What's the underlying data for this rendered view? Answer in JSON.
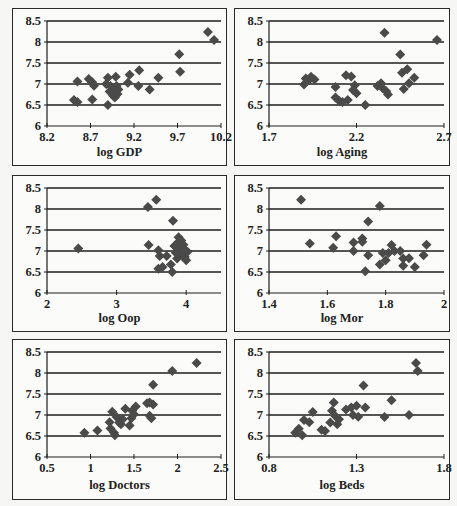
{
  "figure": {
    "panel_count": 6,
    "marker": "diamond",
    "marker_color": "#4a4a4a",
    "gridline_color": "#1e1e1e"
  },
  "chart_data": [
    {
      "type": "scatter",
      "title": "",
      "xlabel": "log GDP",
      "ylabel": "",
      "xlim": [
        8.2,
        10.2
      ],
      "ylim": [
        6,
        8.5
      ],
      "xticks": [
        "8.2",
        "8.7",
        "9.2",
        "9.7",
        "10.2"
      ],
      "xtick_values": [
        8.2,
        8.7,
        9.2,
        9.7,
        10.2
      ],
      "yticks": [
        "6",
        "6.5",
        "7",
        "7.5",
        "8",
        "8.5"
      ],
      "ytick_values": [
        6,
        6.5,
        7,
        7.5,
        8,
        8.5
      ],
      "grid": "horizontal",
      "points": [
        [
          8.51,
          6.62
        ],
        [
          8.55,
          6.57
        ],
        [
          8.55,
          7.06
        ],
        [
          8.68,
          7.12
        ],
        [
          8.72,
          7.04
        ],
        [
          8.72,
          6.63
        ],
        [
          8.74,
          6.96
        ],
        [
          8.88,
          7.0
        ],
        [
          8.9,
          7.15
        ],
        [
          8.9,
          6.5
        ],
        [
          8.92,
          6.82
        ],
        [
          8.93,
          6.95
        ],
        [
          8.95,
          6.78
        ],
        [
          8.96,
          6.72
        ],
        [
          8.97,
          6.88
        ],
        [
          8.98,
          6.68
        ],
        [
          8.99,
          7.17
        ],
        [
          9.0,
          6.95
        ],
        [
          9.01,
          6.76
        ],
        [
          9.02,
          6.87
        ],
        [
          9.13,
          7.03
        ],
        [
          9.15,
          7.22
        ],
        [
          9.25,
          6.95
        ],
        [
          9.26,
          7.33
        ],
        [
          9.38,
          6.87
        ],
        [
          9.48,
          7.15
        ],
        [
          9.72,
          7.71
        ],
        [
          9.73,
          7.29
        ],
        [
          10.05,
          8.24
        ],
        [
          10.12,
          8.05
        ]
      ]
    },
    {
      "type": "scatter",
      "title": "",
      "xlabel": "log Aging",
      "ylabel": "",
      "xlim": [
        1.7,
        2.7
      ],
      "ylim": [
        6,
        8.5
      ],
      "xticks": [
        "1.7",
        "2.2",
        "2.7"
      ],
      "xtick_values": [
        1.7,
        2.2,
        2.7
      ],
      "yticks": [
        "6",
        "6.5",
        "7",
        "7.5",
        "8",
        "8.5"
      ],
      "ytick_values": [
        6,
        6.5,
        7,
        7.5,
        8,
        8.5
      ],
      "grid": "horizontal",
      "points": [
        [
          1.9,
          6.99
        ],
        [
          1.91,
          7.13
        ],
        [
          1.93,
          7.1
        ],
        [
          1.94,
          7.17
        ],
        [
          1.96,
          7.11
        ],
        [
          2.08,
          6.93
        ],
        [
          2.08,
          6.68
        ],
        [
          2.1,
          6.6
        ],
        [
          2.12,
          6.57
        ],
        [
          2.14,
          7.21
        ],
        [
          2.15,
          6.62
        ],
        [
          2.17,
          7.18
        ],
        [
          2.18,
          6.86
        ],
        [
          2.19,
          6.97
        ],
        [
          2.2,
          6.78
        ],
        [
          2.25,
          6.5
        ],
        [
          2.32,
          6.95
        ],
        [
          2.34,
          7.02
        ],
        [
          2.35,
          6.9
        ],
        [
          2.36,
          8.22
        ],
        [
          2.37,
          6.83
        ],
        [
          2.38,
          6.75
        ],
        [
          2.45,
          7.7
        ],
        [
          2.46,
          7.27
        ],
        [
          2.47,
          6.88
        ],
        [
          2.49,
          7.35
        ],
        [
          2.5,
          7.02
        ],
        [
          2.53,
          7.15
        ],
        [
          2.66,
          8.05
        ]
      ]
    },
    {
      "type": "scatter",
      "title": "",
      "xlabel": "log Oop",
      "ylabel": "",
      "xlim": [
        2,
        4.5
      ],
      "ylim": [
        6,
        8.5
      ],
      "xticks": [
        "2",
        "3",
        "4"
      ],
      "xtick_values": [
        2,
        3,
        4
      ],
      "yticks": [
        "6",
        "6.5",
        "7",
        "7.5",
        "8",
        "8.5"
      ],
      "ytick_values": [
        6,
        6.5,
        7,
        7.5,
        8,
        8.5
      ],
      "grid": "horizontal",
      "points": [
        [
          2.45,
          7.06
        ],
        [
          3.45,
          8.05
        ],
        [
          3.57,
          8.22
        ],
        [
          3.46,
          7.14
        ],
        [
          3.6,
          7.02
        ],
        [
          3.62,
          6.88
        ],
        [
          3.6,
          6.58
        ],
        [
          3.66,
          6.62
        ],
        [
          3.72,
          6.88
        ],
        [
          3.78,
          6.68
        ],
        [
          3.8,
          6.5
        ],
        [
          3.81,
          7.72
        ],
        [
          3.83,
          7.12
        ],
        [
          3.85,
          6.96
        ],
        [
          3.87,
          6.82
        ],
        [
          3.88,
          7.2
        ],
        [
          3.89,
          7.33
        ],
        [
          3.9,
          6.98
        ],
        [
          3.92,
          7.08
        ],
        [
          3.93,
          7.25
        ],
        [
          3.94,
          6.9
        ],
        [
          3.95,
          7.02
        ],
        [
          3.96,
          7.15
        ],
        [
          3.98,
          6.86
        ],
        [
          4.0,
          6.78
        ],
        [
          4.02,
          6.98
        ],
        [
          3.97,
          7.05
        ]
      ]
    },
    {
      "type": "scatter",
      "title": "",
      "xlabel": "log Mor",
      "ylabel": "",
      "xlim": [
        1.4,
        2.0
      ],
      "ylim": [
        6,
        8.5
      ],
      "xticks": [
        "1.4",
        "1.6",
        "1.8",
        "2"
      ],
      "xtick_values": [
        1.4,
        1.6,
        1.8,
        2.0
      ],
      "yticks": [
        "6",
        "6.5",
        "7",
        "7.5",
        "8",
        "8.5"
      ],
      "ytick_values": [
        6,
        6.5,
        7,
        7.5,
        8,
        8.5
      ],
      "grid": "horizontal",
      "points": [
        [
          1.51,
          8.22
        ],
        [
          1.54,
          7.18
        ],
        [
          1.62,
          7.08
        ],
        [
          1.63,
          7.35
        ],
        [
          1.69,
          7.2
        ],
        [
          1.69,
          7.0
        ],
        [
          1.72,
          7.3
        ],
        [
          1.72,
          7.22
        ],
        [
          1.73,
          6.52
        ],
        [
          1.74,
          7.7
        ],
        [
          1.74,
          6.9
        ],
        [
          1.78,
          8.07
        ],
        [
          1.78,
          6.68
        ],
        [
          1.79,
          6.95
        ],
        [
          1.8,
          6.78
        ],
        [
          1.81,
          6.95
        ],
        [
          1.82,
          7.14
        ],
        [
          1.83,
          7.0
        ],
        [
          1.85,
          7.0
        ],
        [
          1.86,
          6.82
        ],
        [
          1.86,
          6.65
        ],
        [
          1.88,
          6.83
        ],
        [
          1.9,
          6.62
        ],
        [
          1.93,
          6.9
        ],
        [
          1.94,
          7.15
        ]
      ]
    },
    {
      "type": "scatter",
      "title": "",
      "xlabel": "log Doctors",
      "ylabel": "",
      "xlim": [
        0.5,
        2.5
      ],
      "ylim": [
        6,
        8.5
      ],
      "xticks": [
        "0.5",
        "1",
        "1.5",
        "2",
        "2.5"
      ],
      "xtick_values": [
        0.5,
        1.0,
        1.5,
        2.0,
        2.5
      ],
      "yticks": [
        "6",
        "6.5",
        "7",
        "7.5",
        "8",
        "8.5"
      ],
      "ytick_values": [
        6,
        6.5,
        7,
        7.5,
        8,
        8.5
      ],
      "grid": "horizontal",
      "points": [
        [
          0.93,
          6.58
        ],
        [
          1.08,
          6.63
        ],
        [
          1.22,
          6.83
        ],
        [
          1.23,
          6.68
        ],
        [
          1.25,
          7.08
        ],
        [
          1.27,
          6.58
        ],
        [
          1.28,
          6.52
        ],
        [
          1.3,
          6.95
        ],
        [
          1.33,
          6.82
        ],
        [
          1.35,
          6.78
        ],
        [
          1.37,
          6.9
        ],
        [
          1.4,
          7.15
        ],
        [
          1.45,
          6.75
        ],
        [
          1.47,
          6.92
        ],
        [
          1.48,
          7.1
        ],
        [
          1.5,
          7.02
        ],
        [
          1.52,
          7.2
        ],
        [
          1.65,
          7.28
        ],
        [
          1.68,
          7.3
        ],
        [
          1.68,
          6.98
        ],
        [
          1.7,
          6.92
        ],
        [
          1.72,
          7.25
        ],
        [
          1.72,
          7.72
        ],
        [
          1.94,
          8.05
        ],
        [
          2.22,
          8.24
        ]
      ]
    },
    {
      "type": "scatter",
      "title": "",
      "xlabel": "log Beds",
      "ylabel": "",
      "xlim": [
        0.8,
        1.8
      ],
      "ylim": [
        6,
        8.5
      ],
      "xticks": [
        "0.8",
        "1.3",
        "1.8"
      ],
      "xtick_values": [
        0.8,
        1.3,
        1.8
      ],
      "yticks": [
        "6",
        "6.5",
        "7",
        "7.5",
        "8",
        "8.5"
      ],
      "ytick_values": [
        6,
        6.5,
        7,
        7.5,
        8,
        8.5
      ],
      "grid": "horizontal",
      "points": [
        [
          0.95,
          6.58
        ],
        [
          0.97,
          6.67
        ],
        [
          0.99,
          6.52
        ],
        [
          1.0,
          6.88
        ],
        [
          1.03,
          6.83
        ],
        [
          1.05,
          7.07
        ],
        [
          1.1,
          6.65
        ],
        [
          1.12,
          6.62
        ],
        [
          1.15,
          6.82
        ],
        [
          1.16,
          7.1
        ],
        [
          1.17,
          7.3
        ],
        [
          1.18,
          6.97
        ],
        [
          1.19,
          6.78
        ],
        [
          1.2,
          6.9
        ],
        [
          1.24,
          7.13
        ],
        [
          1.27,
          7.18
        ],
        [
          1.28,
          7.0
        ],
        [
          1.3,
          7.22
        ],
        [
          1.31,
          6.96
        ],
        [
          1.34,
          7.7
        ],
        [
          1.35,
          7.18
        ],
        [
          1.46,
          6.95
        ],
        [
          1.5,
          7.35
        ],
        [
          1.6,
          7.0
        ],
        [
          1.64,
          8.24
        ],
        [
          1.65,
          8.05
        ]
      ]
    }
  ]
}
